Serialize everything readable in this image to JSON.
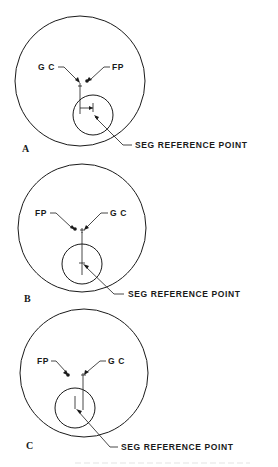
{
  "figure": {
    "panels": [
      {
        "id": "A",
        "label": "A",
        "gc_label": "G C",
        "fp_label": "FP",
        "seg_label": "SEG REFERENCE POINT",
        "arrangement": "GC left, FP right; SEG reference point offset to the right of GC vertical"
      },
      {
        "id": "B",
        "label": "B",
        "gc_label": "G C",
        "fp_label": "FP",
        "seg_label": "SEG REFERENCE POINT",
        "arrangement": "FP left, GC right; SEG reference point aligned with GC vertical"
      },
      {
        "id": "C",
        "label": "C",
        "gc_label": "G C",
        "fp_label": "FP",
        "seg_label": "SEG REFERENCE POINT",
        "arrangement": "FP left, GC right; SEG reference point offset to the left of GC vertical"
      }
    ],
    "caption": ""
  }
}
